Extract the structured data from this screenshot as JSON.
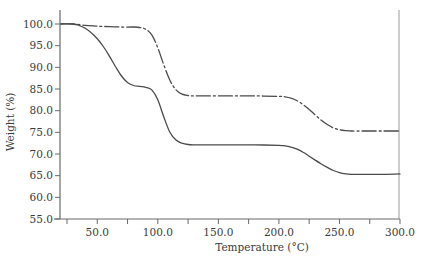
{
  "chart_data": {
    "type": "line",
    "title": "",
    "xlabel": "Temperature (°C)",
    "ylabel": "Weight (%)",
    "xlim": [
      20,
      300
    ],
    "ylim": [
      55,
      100
    ],
    "x_ticks": [
      {
        "value": 25,
        "label": ""
      },
      {
        "value": 50,
        "label": "50.0"
      },
      {
        "value": 75,
        "label": ""
      },
      {
        "value": 100,
        "label": "100.0"
      },
      {
        "value": 125,
        "label": ""
      },
      {
        "value": 150,
        "label": "150.0"
      },
      {
        "value": 175,
        "label": ""
      },
      {
        "value": 200,
        "label": "200.0"
      },
      {
        "value": 225,
        "label": ""
      },
      {
        "value": 250,
        "label": "250.0"
      },
      {
        "value": 275,
        "label": ""
      },
      {
        "value": 300,
        "label": "300.0"
      }
    ],
    "y_ticks": [
      {
        "value": 55,
        "label": "55.0"
      },
      {
        "value": 60,
        "label": "60.0"
      },
      {
        "value": 65,
        "label": "65.0"
      },
      {
        "value": 70,
        "label": "70.0"
      },
      {
        "value": 75,
        "label": "75.0"
      },
      {
        "value": 80,
        "label": "80.0"
      },
      {
        "value": 85,
        "label": "85.0"
      },
      {
        "value": 90,
        "label": "90.0"
      },
      {
        "value": 95,
        "label": "95.0"
      },
      {
        "value": 100,
        "label": "100.0"
      }
    ],
    "grid": false,
    "legend": null,
    "series": [
      {
        "name": "solid",
        "style": "solid",
        "color": "#4a4a4a",
        "x": [
          20,
          30,
          35,
          40,
          45,
          50,
          55,
          60,
          65,
          70,
          75,
          80,
          85,
          90,
          95,
          100,
          105,
          110,
          115,
          120,
          125,
          130,
          140,
          160,
          180,
          200,
          205,
          210,
          215,
          220,
          225,
          230,
          235,
          240,
          245,
          250,
          255,
          260,
          270,
          285,
          300
        ],
        "y": [
          100.0,
          100.0,
          99.7,
          99.0,
          98.0,
          96.6,
          94.8,
          92.6,
          90.2,
          88.0,
          86.5,
          85.8,
          85.6,
          85.4,
          84.8,
          82.5,
          78.5,
          75.0,
          73.2,
          72.5,
          72.2,
          72.1,
          72.1,
          72.1,
          72.1,
          72.0,
          71.9,
          71.6,
          71.1,
          70.4,
          69.5,
          68.6,
          67.7,
          66.9,
          66.2,
          65.7,
          65.4,
          65.3,
          65.3,
          65.3,
          65.4
        ]
      },
      {
        "name": "dash-dot",
        "style": "dashdot",
        "color": "#4a4a4a",
        "x": [
          20,
          30,
          40,
          50,
          60,
          70,
          80,
          85,
          90,
          95,
          100,
          105,
          110,
          115,
          120,
          125,
          130,
          140,
          160,
          180,
          200,
          205,
          210,
          215,
          220,
          225,
          230,
          235,
          240,
          245,
          250,
          255,
          260,
          270,
          285,
          300
        ],
        "y": [
          100.0,
          100.0,
          99.7,
          99.5,
          99.4,
          99.3,
          99.3,
          99.2,
          98.8,
          97.5,
          94.5,
          90.5,
          87.0,
          84.8,
          83.8,
          83.5,
          83.4,
          83.4,
          83.4,
          83.4,
          83.3,
          83.2,
          82.9,
          82.3,
          81.4,
          80.3,
          79.0,
          77.8,
          76.8,
          76.0,
          75.6,
          75.4,
          75.3,
          75.3,
          75.3,
          75.3
        ]
      }
    ]
  },
  "layout": {
    "plot_left": 60,
    "plot_right": 400,
    "plot_top": 24,
    "plot_bottom": 219,
    "axis_color": "#6a6a6a",
    "text_color": "#3a3a3a"
  }
}
